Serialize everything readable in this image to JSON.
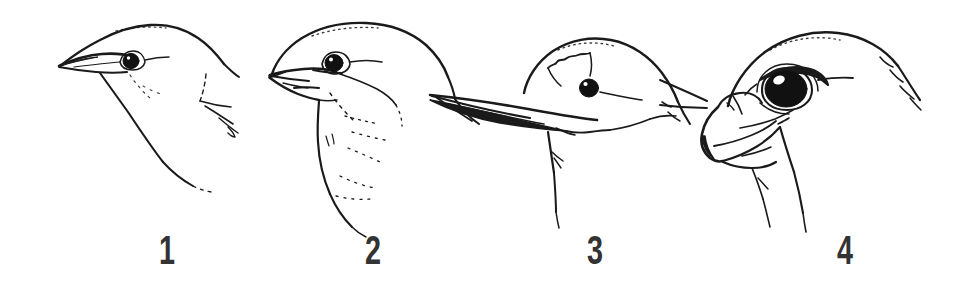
{
  "figure": {
    "background_color": "#ffffff",
    "ink_color": "#1a1a1a",
    "caption_color": "#333333",
    "width": 961,
    "height": 304
  },
  "panels": [
    {
      "number": "1",
      "label_x": 167,
      "bill_type": "thin pointed insect-eater bill",
      "bird_head_name": "warbler-type head",
      "eye": {
        "cx": 131,
        "cy": 61,
        "r": 7.5
      }
    },
    {
      "number": "2",
      "label_x": 373,
      "bill_type": "thick conical seed-cracking bill",
      "bird_head_name": "finch-type head",
      "eye": {
        "cx": 334,
        "cy": 63,
        "r": 8.5
      }
    },
    {
      "number": "3",
      "label_x": 595,
      "bill_type": "long straight dagger bill",
      "bird_head_name": "heron-type head",
      "eye": {
        "cx": 589,
        "cy": 88,
        "r": 9
      }
    },
    {
      "number": "4",
      "label_x": 845,
      "bill_type": "short hooked raptor bill with cere",
      "bird_head_name": "hawk-type head",
      "eye": {
        "cx": 786,
        "cy": 88,
        "rx": 20,
        "ry": 17
      }
    }
  ]
}
